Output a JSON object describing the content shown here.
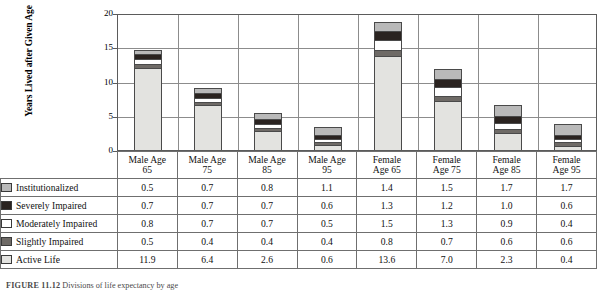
{
  "chart_data": {
    "type": "bar",
    "stacked": true,
    "title": "",
    "xlabel": "",
    "ylabel": "Years Lived after Given Age",
    "ylim": [
      0,
      20
    ],
    "yticks": [
      0,
      5,
      10,
      15,
      20
    ],
    "grid": true,
    "legend_position": "table-left-column",
    "categories": [
      "Male Age 65",
      "Male Age 75",
      "Male Age 85",
      "Male Age 95",
      "Female Age 65",
      "Female Age 75",
      "Female Age 85",
      "Female Age 95"
    ],
    "category_lines": [
      [
        "Male Age",
        "65"
      ],
      [
        "Male Age",
        "75"
      ],
      [
        "Male Age",
        "85"
      ],
      [
        "Male Age",
        "95"
      ],
      [
        "Female",
        "Age 65"
      ],
      [
        "Female",
        "Age 75"
      ],
      [
        "Female",
        "Age 85"
      ],
      [
        "Female",
        "Age 95"
      ]
    ],
    "series": [
      {
        "name": "Institutionalized",
        "color": "#b9b9b9",
        "values": [
          0.5,
          0.7,
          0.8,
          1.1,
          1.4,
          1.5,
          1.7,
          1.7
        ]
      },
      {
        "name": "Severely Impaired",
        "color": "#2a2320",
        "values": [
          0.7,
          0.7,
          0.7,
          0.6,
          1.3,
          1.2,
          1.0,
          0.6
        ]
      },
      {
        "name": "Moderately Impaired",
        "color": "#ffffff",
        "values": [
          0.8,
          0.7,
          0.7,
          0.5,
          1.5,
          1.3,
          0.9,
          0.4
        ]
      },
      {
        "name": "Slightly Impaired",
        "color": "#6e6a66",
        "values": [
          0.5,
          0.4,
          0.4,
          0.4,
          0.8,
          0.7,
          0.6,
          0.6
        ]
      },
      {
        "name": "Active Life",
        "color": "#e3e3e0",
        "values": [
          11.9,
          6.4,
          2.6,
          0.6,
          13.6,
          7.0,
          2.3,
          0.4
        ]
      }
    ],
    "totals": [
      14.4,
      8.9,
      5.2,
      3.2,
      18.6,
      11.7,
      6.5,
      3.7
    ]
  },
  "caption": {
    "label": "FIGURE 11.12",
    "text": "Divisions of life expectancy by age"
  }
}
